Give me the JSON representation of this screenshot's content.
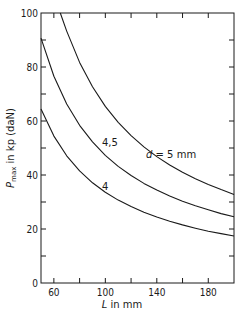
{
  "chart_data": {
    "type": "line",
    "title": "",
    "xlabel": "L in mm",
    "ylabel": "P_max in kp (daN)",
    "xlim": [
      50,
      200
    ],
    "ylim": [
      0,
      100
    ],
    "x_ticks": [
      60,
      100,
      140,
      180
    ],
    "x_minor_ticks": [
      60,
      80,
      100,
      120,
      140,
      160,
      180
    ],
    "y_ticks": [
      0,
      20,
      40,
      60,
      80,
      100
    ],
    "y_minor_ticks": [
      10,
      30,
      50,
      70,
      90
    ],
    "grid": false,
    "legend": "inline labels on curves",
    "series": [
      {
        "name": "d = 5 mm",
        "label": "d = 5 mm",
        "x": [
          65,
          70,
          80,
          90,
          100,
          110,
          120,
          130,
          140,
          150,
          160,
          170,
          180,
          190,
          200
        ],
        "y": [
          100,
          93.3,
          81.7,
          72.7,
          65.4,
          59.5,
          54.6,
          50.4,
          46.8,
          43.7,
          41.0,
          38.6,
          36.5,
          34.6,
          32.8
        ]
      },
      {
        "name": "4,5",
        "label": "4,5",
        "x": [
          50,
          60,
          70,
          80,
          90,
          100,
          110,
          120,
          130,
          140,
          150,
          160,
          170,
          180,
          190,
          200
        ],
        "y": [
          90.7,
          76.6,
          66.3,
          58.4,
          52.3,
          47.3,
          43.2,
          39.8,
          36.9,
          34.4,
          32.2,
          30.3,
          28.6,
          27.1,
          25.7,
          24.5
        ]
      },
      {
        "name": "4",
        "label": "4",
        "x": [
          50,
          60,
          70,
          80,
          90,
          100,
          110,
          120,
          130,
          140,
          150,
          160,
          170,
          180,
          190,
          200
        ],
        "y": [
          64.4,
          54.4,
          47.1,
          41.5,
          37.1,
          33.6,
          30.7,
          28.3,
          26.2,
          24.4,
          22.9,
          21.5,
          20.3,
          19.2,
          18.3,
          17.4
        ]
      }
    ]
  },
  "labels": {
    "y_axis_main": "P",
    "y_axis_sub": "max",
    "y_axis_rest": " in kp (daN)",
    "x_axis_var": "L",
    "x_axis_rest": " in mm",
    "curve_d5_var": "d",
    "curve_d5_rest": " = 5 mm",
    "curve_d45": "4,5",
    "curve_d4": "4"
  },
  "tick_labels": {
    "x": [
      "60",
      "100",
      "140",
      "180"
    ],
    "y": [
      "0",
      "20",
      "40",
      "60",
      "80",
      "100"
    ]
  },
  "colors": {
    "line": "#1a1a1a",
    "background": "#ffffff"
  }
}
